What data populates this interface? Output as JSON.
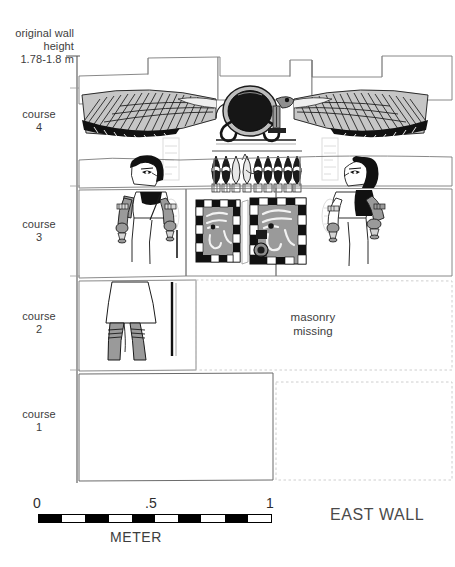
{
  "figure": {
    "title_label": "EAST WALL",
    "header_note": "original wall\nheight\n1.78-1.8 m",
    "annotation_masonry_missing": "masonry\nmissing",
    "courses": [
      {
        "id": "course-4",
        "label": "course\n4"
      },
      {
        "id": "course-3",
        "label": "course\n3"
      },
      {
        "id": "course-2",
        "label": "course\n2"
      },
      {
        "id": "course-1",
        "label": "course\n1"
      }
    ],
    "scale": {
      "unit_label": "METER",
      "ticks": [
        "0",
        ".5",
        "1"
      ],
      "segments": 10,
      "first_segment": "dark",
      "total_meters": 1
    },
    "colors": {
      "ink": "#000000",
      "text": "#3d3d3d",
      "stone_fill": "#ffffff",
      "stone_outline": "#6b6b6b",
      "relief_gray": "#9a9a9a",
      "relief_light": "#c9c9c9",
      "hieroglyph_ghost": "#dedede",
      "wig_black": "#111111"
    },
    "relief_elements": [
      {
        "name": "winged-sun-disk",
        "course": "course-4",
        "description": "winged solar disk with flanking uraei"
      },
      {
        "name": "kheker-frieze",
        "course": "course-4",
        "description": "row of kheker ornaments"
      },
      {
        "name": "figure-left",
        "course": "course-3",
        "description": "standing figure facing right with wig and offering vessels"
      },
      {
        "name": "figure-right",
        "course": "course-3",
        "description": "standing figure facing left with wig and offering vessels"
      },
      {
        "name": "wadjet-eye-left",
        "course": "course-3",
        "description": "Eye of Horus panel with checkered border"
      },
      {
        "name": "wadjet-eye-right",
        "course": "course-3",
        "description": "Eye of Horus panel with checkered border"
      },
      {
        "name": "figure-lower-body",
        "course": "course-2",
        "description": "kilt and legs of standing figure"
      }
    ]
  }
}
